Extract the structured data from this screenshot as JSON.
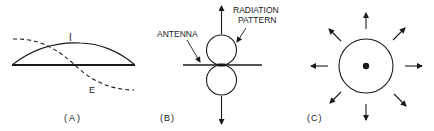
{
  "panels": [
    {
      "id": "A",
      "label": "(A)",
      "curves": [
        {
          "name": "I",
          "label": "I",
          "style": "solid",
          "description": "current distribution"
        },
        {
          "name": "E",
          "label": "E",
          "style": "dashed",
          "description": "voltage distribution"
        }
      ]
    },
    {
      "id": "B",
      "label": "(B)",
      "annotations": {
        "antenna": "ANTENNA",
        "pattern_line1": "RADIATION",
        "pattern_line2": "PATTERN"
      }
    },
    {
      "id": "C",
      "label": "(C)",
      "arrow_count": 8
    }
  ],
  "colors": {
    "ink": "#1a1a1a",
    "background": "#ffffff"
  }
}
